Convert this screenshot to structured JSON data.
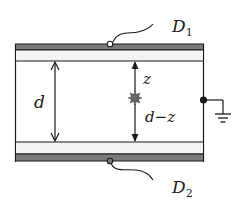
{
  "diagram": {
    "type": "parallel-plate-detector-schematic",
    "labels": {
      "top_electrode": "D",
      "top_electrode_sub": "1",
      "bottom_electrode": "D",
      "bottom_electrode_sub": "2",
      "gap": "d",
      "charge_to_top": "z",
      "charge_to_bottom": "d−z"
    },
    "elements": {
      "plates": 2,
      "charge_marker": "starburst",
      "ground_symbol": true
    },
    "colors": {
      "plate": "#7a7a7a",
      "plate_coating": "#f4f4f4",
      "line": "#1a1a1a",
      "charge": "#555555"
    }
  }
}
